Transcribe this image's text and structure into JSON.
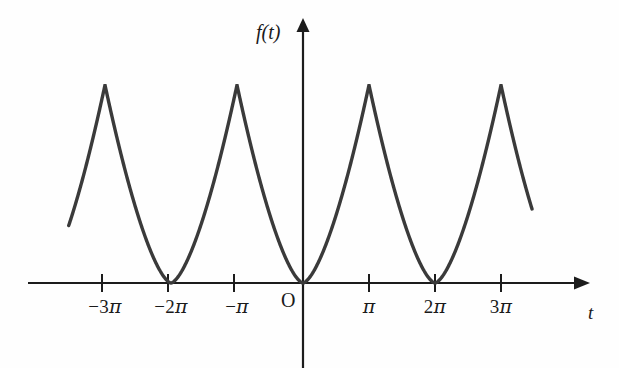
{
  "figure": {
    "title": "",
    "background_color": "#fefefe",
    "curve_color": "#3a3a3a",
    "axis_color": "#1c1c1c"
  },
  "axes": {
    "y_axis_label": "f(t)",
    "x_axis_label": "t",
    "origin_label": "O",
    "x_ticks": [
      {
        "label_minus": "−",
        "label_num": "3",
        "label_pi": "π",
        "value": -3
      },
      {
        "label_minus": "−",
        "label_num": "2",
        "label_pi": "π",
        "value": -2
      },
      {
        "label_minus": "−",
        "label_num": "",
        "label_pi": "π",
        "value": -1
      },
      {
        "label_minus": "",
        "label_num": "",
        "label_pi": "π",
        "value": 1
      },
      {
        "label_minus": "",
        "label_num": "2",
        "label_pi": "π",
        "value": 2
      },
      {
        "label_minus": "",
        "label_num": "3",
        "label_pi": "π",
        "value": 3
      }
    ]
  },
  "chart_data": {
    "type": "line",
    "title": "",
    "xlabel": "t",
    "ylabel": "f(t)",
    "xlim": [
      -3.55,
      3.5
    ],
    "ylim": [
      0,
      1.18
    ],
    "grid": false,
    "legend": null,
    "period_pi": 2,
    "x_tick_values": [
      -3,
      -2,
      -1,
      1,
      2,
      3
    ],
    "x_tick_labels": [
      "−3π",
      "−2π",
      "−π",
      "π",
      "2π",
      "3π"
    ],
    "minima_at_pi": [
      -2,
      0,
      2
    ],
    "maxima_at_pi": [
      -3,
      -1,
      1,
      3
    ],
    "minimum_value": 0,
    "maximum_value": 1,
    "x_start_pi": -3.55,
    "x_end_pi": 3.47,
    "series": [
      {
        "name": "f(t)",
        "x_pi": [
          -3.55,
          -3.4,
          -3.2,
          -3.0,
          -2.8,
          -2.6,
          -2.4,
          -2.2,
          -2.0,
          -1.8,
          -1.6,
          -1.4,
          -1.2,
          -1.0,
          -0.8,
          -0.6,
          -0.4,
          -0.2,
          0.0,
          0.2,
          0.4,
          0.6,
          0.8,
          1.0,
          1.2,
          1.4,
          1.6,
          1.8,
          2.0,
          2.2,
          2.4,
          2.6,
          2.8,
          3.0,
          3.2,
          3.4,
          3.47
        ],
        "y": [
          0.69,
          0.81,
          0.91,
          1.0,
          0.9,
          0.72,
          0.49,
          0.23,
          0.0,
          0.23,
          0.49,
          0.72,
          0.9,
          1.0,
          0.9,
          0.72,
          0.49,
          0.23,
          0.0,
          0.23,
          0.49,
          0.72,
          0.9,
          1.0,
          0.9,
          0.72,
          0.49,
          0.23,
          0.0,
          0.23,
          0.49,
          0.72,
          0.9,
          1.0,
          0.91,
          0.81,
          0.73
        ]
      }
    ]
  }
}
